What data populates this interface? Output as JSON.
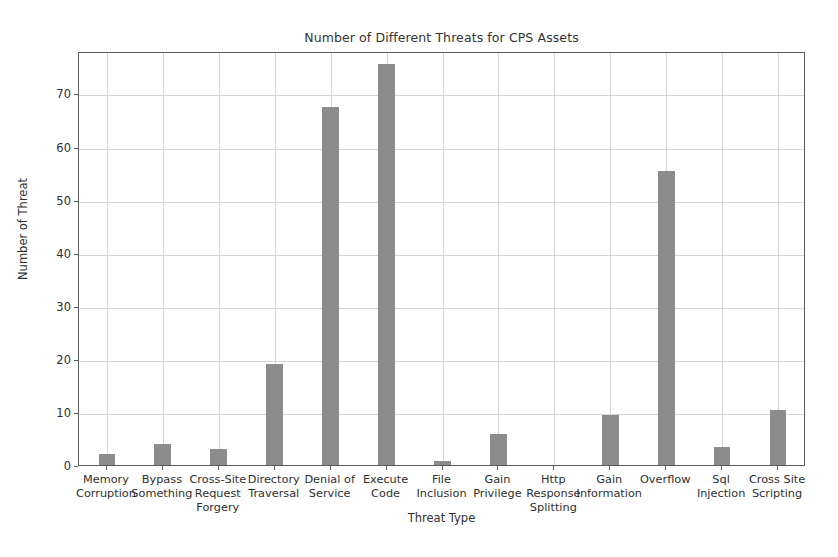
{
  "chart_data": {
    "type": "bar",
    "title": "Number of Different Threats for CPS Assets",
    "xlabel": "Threat Type",
    "ylabel": "Number of Threat",
    "categories": [
      "Memory\nCorruption",
      "Bypass\nSomething",
      "Cross-Site\nRequest\nForgery",
      "Directory\nTraversal",
      "Denial of\nService",
      "Execute\nCode",
      "File\nInclusion",
      "Gain\nPrivilege",
      "Http Response\nSplitting",
      "Gain\nInformation",
      "Overflow",
      "Sql\nInjection",
      "Cross Site\nScripting"
    ],
    "values": [
      2,
      4,
      3,
      19,
      67.5,
      75.5,
      0.8,
      5.8,
      0,
      9.5,
      55.4,
      3.4,
      10.3
    ],
    "ylim": [
      0,
      78
    ],
    "yticks": [
      0,
      10,
      20,
      30,
      40,
      50,
      60,
      70
    ],
    "ytick_labels": [
      "0",
      "10",
      "20",
      "30",
      "40",
      "50",
      "60",
      "70"
    ],
    "grid": true,
    "legend": false,
    "bar_color": "#8c8c8c",
    "grid_color": "#d6d6d6",
    "axis_color": "#5b5b5b",
    "background": "#ffffff"
  }
}
